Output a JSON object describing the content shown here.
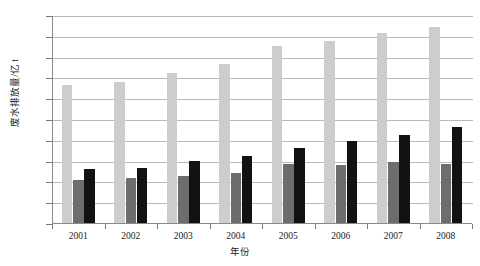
{
  "chart_data": {
    "type": "bar",
    "title": "",
    "xlabel": "年份",
    "ylabel": "废水排放量/亿 t",
    "categories": [
      "2001",
      "2002",
      "2003",
      "2004",
      "2005",
      "2006",
      "2007",
      "2008"
    ],
    "series": [
      {
        "name": "series-1",
        "color": "#cdcdcd",
        "values": [
          433,
          440,
          460,
          483,
          525,
          537,
          557,
          572
        ]
      },
      {
        "name": "series-2",
        "color": "#6d6d6d",
        "values": [
          203,
          208,
          212,
          221,
          243,
          240,
          247,
          242
        ]
      },
      {
        "name": "series-3",
        "color": "#121212",
        "values": [
          230,
          233,
          248,
          262,
          281,
          297,
          311,
          331
        ]
      }
    ],
    "ylim": [
      100,
      600
    ],
    "yticks": [
      100,
      150,
      200,
      250,
      300,
      350,
      400,
      450,
      500,
      550,
      600
    ],
    "grid": true,
    "legend": "none",
    "legend_position": "none"
  }
}
